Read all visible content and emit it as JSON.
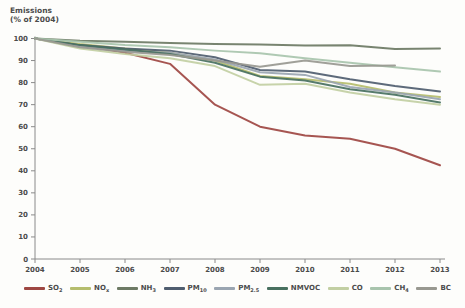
{
  "title": {
    "line1": "Emissions",
    "line2": "(% of 2004)"
  },
  "chart_data": {
    "type": "line",
    "title": "",
    "ylabel": "Emissions (% of 2004)",
    "xlabel": "",
    "grid": false,
    "legend_position": "bottom",
    "categories": [
      "2004",
      "2005",
      "2006",
      "2007",
      "2008",
      "2009",
      "2010",
      "2011",
      "2012",
      "2013"
    ],
    "ylim": [
      0,
      100
    ],
    "yticks": [
      0,
      10,
      20,
      30,
      40,
      50,
      60,
      70,
      80,
      90,
      100
    ],
    "axis_color": "#8a8a8a",
    "tick_label_color": "#4b4b4b",
    "series": [
      {
        "name": "SO2",
        "label": "SO",
        "sub": "2",
        "color": "#9e4742",
        "values": [
          100,
          97,
          93.5,
          88.5,
          70,
          60,
          56,
          54.5,
          50,
          42.5
        ]
      },
      {
        "name": "NOx",
        "label": "NO",
        "sub": "x",
        "color": "#b5bd6d",
        "values": [
          100,
          97.5,
          95.5,
          93.5,
          90,
          83,
          81.5,
          79.5,
          75.5,
          73.5
        ]
      },
      {
        "name": "NH3",
        "label": "NH",
        "sub": "3",
        "color": "#6d7a64",
        "values": [
          100,
          99,
          98.5,
          98,
          97.5,
          97.3,
          96.8,
          96.9,
          95.2,
          95.5
        ]
      },
      {
        "name": "PM10",
        "label": "PM",
        "sub": "10",
        "color": "#4f5d6f",
        "values": [
          100,
          97,
          95.5,
          94.5,
          91.5,
          85.7,
          85,
          81.5,
          78.5,
          76
        ]
      },
      {
        "name": "PM2.5",
        "label": "PM",
        "sub": "2.5",
        "color": "#9aa5b1",
        "values": [
          100,
          96.5,
          94.5,
          93.5,
          90.5,
          84.7,
          83.5,
          78,
          75.5,
          72.5
        ]
      },
      {
        "name": "NMVOC",
        "label": "NMVOC",
        "sub": "",
        "color": "#48705f",
        "values": [
          100,
          97,
          95,
          93,
          89,
          82.7,
          81,
          77,
          74.5,
          71
        ]
      },
      {
        "name": "CO",
        "label": "CO",
        "sub": "",
        "color": "#c2cfa3",
        "values": [
          100,
          95.5,
          93,
          91,
          87.5,
          79,
          79.5,
          75.5,
          72.5,
          70
        ]
      },
      {
        "name": "CH4",
        "label": "CH",
        "sub": "4",
        "color": "#a8c4ad",
        "values": [
          100,
          98.5,
          97,
          96,
          94.5,
          93.3,
          91,
          89,
          87,
          85
        ]
      },
      {
        "name": "BC",
        "label": "BC",
        "sub": "",
        "color": "#989890",
        "values": [
          100,
          96,
          94,
          92.5,
          90,
          87.2,
          90,
          87.5,
          87.8,
          null
        ]
      }
    ]
  }
}
